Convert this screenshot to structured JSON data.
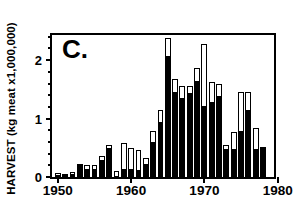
{
  "chart_data": {
    "type": "bar",
    "title": "C.",
    "panel_label": "C.",
    "xlabel": "",
    "ylabel": "HARVEST  (kg meat x1,000,000)",
    "ylim": [
      0,
      2.43
    ],
    "xlim": [
      1949.2,
      1979.5
    ],
    "grid": false,
    "legend_position": "none",
    "stacked": true,
    "y_major_ticks": [
      0,
      1,
      2
    ],
    "y_major_tick_labels": [
      "0",
      "1",
      "2"
    ],
    "y_minor_ticks": [
      0.2,
      0.4,
      0.6,
      0.8,
      1.2,
      1.4,
      1.6,
      1.8,
      2.2,
      2.4
    ],
    "x_major_ticks": [
      1950,
      1960,
      1970,
      1980
    ],
    "x_major_tick_labels": [
      "1950",
      "1960",
      "1970",
      "1980"
    ],
    "series": [
      {
        "name": "solid-black-segment",
        "color": "#000000",
        "values": [
          0.02,
          0.03,
          0.05,
          0.23,
          0.13,
          0.14,
          0.29,
          0.5,
          0.0,
          0.13,
          0.13,
          0.12,
          0.22,
          0.6,
          0.94,
          2.07,
          1.45,
          1.35,
          1.44,
          1.65,
          1.22,
          1.28,
          1.39,
          0.48,
          0.48,
          0.78,
          1.14,
          0.48,
          0.5
        ]
      },
      {
        "name": "open-white-segment",
        "color": "#ffffff",
        "values": [
          0.05,
          0.03,
          0.03,
          0.0,
          0.08,
          0.06,
          0.07,
          0.05,
          0.1,
          0.46,
          0.36,
          0.34,
          0.11,
          0.19,
          0.2,
          0.31,
          0.23,
          0.2,
          0.11,
          0.21,
          1.06,
          0.35,
          0.21,
          0.06,
          0.29,
          0.67,
          0.31,
          0.36,
          0.01
        ]
      }
    ],
    "categories": [
      1950,
      1951,
      1952,
      1953,
      1954,
      1955,
      1956,
      1957,
      1958,
      1959,
      1960,
      1961,
      1962,
      1963,
      1964,
      1965,
      1966,
      1967,
      1968,
      1969,
      1970,
      1971,
      1972,
      1973,
      1974,
      1975,
      1976,
      1977,
      1978
    ],
    "totals": [
      0.07,
      0.06,
      0.08,
      0.23,
      0.21,
      0.2,
      0.36,
      0.55,
      0.1,
      0.59,
      0.49,
      0.46,
      0.33,
      0.79,
      1.14,
      2.38,
      1.68,
      1.55,
      1.55,
      1.86,
      2.28,
      1.63,
      1.6,
      0.54,
      0.77,
      1.45,
      1.45,
      0.84,
      0.51
    ],
    "colors": {
      "axis": "#000000",
      "solid": "#000000",
      "open": "#ffffff",
      "background": "#ffffff"
    }
  }
}
